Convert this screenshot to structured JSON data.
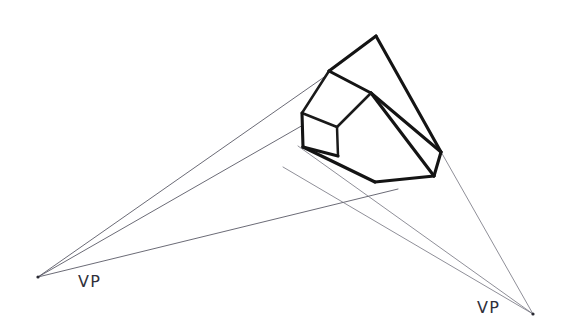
{
  "figure": {
    "background_color": "#ffffff",
    "line_color": "#141414",
    "guide_color": "#5a5a66",
    "label_color": "#30303a",
    "width": 570,
    "height": 336
  },
  "labels": {
    "vp_left": "VP",
    "vp_right": "VP"
  },
  "geometry": {
    "vanishing_points": {
      "left": {
        "x": 38,
        "y": 277
      },
      "right": {
        "x": 533,
        "y": 314
      }
    },
    "label_positions": {
      "left": {
        "x": 78,
        "y": 287
      },
      "right": {
        "x": 477,
        "y": 313
      }
    },
    "box_vertices": {
      "top_apex": {
        "x": 376,
        "y": 36
      },
      "top_left": {
        "x": 329,
        "y": 71
      },
      "top_center": {
        "x": 371,
        "y": 93
      },
      "top_right": {
        "x": 441,
        "y": 152
      },
      "small_face_top_left": {
        "x": 302,
        "y": 113
      },
      "small_face_mid": {
        "x": 337,
        "y": 127
      },
      "small_face_bottom_left": {
        "x": 303,
        "y": 147
      },
      "bottom_center": {
        "x": 375,
        "y": 182
      },
      "bottom_right": {
        "x": 434,
        "y": 176
      }
    },
    "guide_lines_left_vp": [
      {
        "to_x": 329,
        "to_y": 71
      },
      {
        "to_x": 302,
        "to_y": 113
      },
      {
        "to_x": 375,
        "to_y": 182
      }
    ],
    "guide_lines_right_vp": [
      {
        "to_x": 441,
        "to_y": 152
      },
      {
        "to_x": 434,
        "to_y": 176
      },
      {
        "to_x": 303,
        "to_y": 147
      }
    ]
  }
}
